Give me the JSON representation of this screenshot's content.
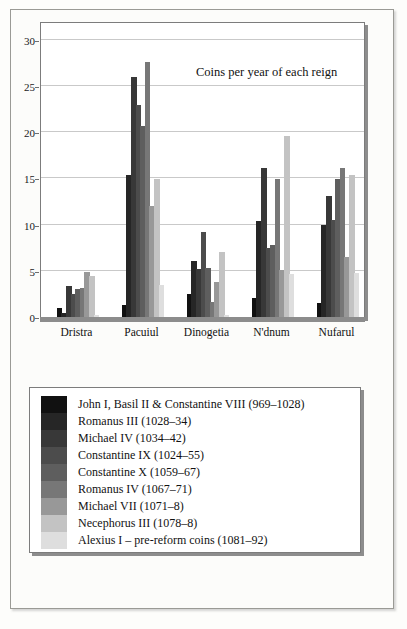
{
  "chart_data": {
    "type": "bar",
    "title": "Coins per year of each reign",
    "xlabel": "",
    "ylabel": "",
    "ylim": [
      0,
      32
    ],
    "yticks": [
      0,
      5,
      10,
      15,
      20,
      25,
      30
    ],
    "grid": true,
    "legend_position": "below-plot",
    "categories": [
      "Dristra",
      "Pacuiul",
      "Dinogetia",
      "N'dnum",
      "Nufarul"
    ],
    "series": [
      {
        "name": "John I, Basil II & Constantine VIII (969–1028)",
        "color": "#111111",
        "values": [
          1.0,
          1.3,
          2.5,
          2.1,
          1.5
        ]
      },
      {
        "name": "Romanus III (1028–34)",
        "color": "#262626",
        "values": [
          0.4,
          15.4,
          6.1,
          10.4,
          9.9
        ]
      },
      {
        "name": "Michael IV (1034–42)",
        "color": "#383838",
        "values": [
          3.4,
          25.9,
          5.2,
          16.1,
          13.1
        ]
      },
      {
        "name": "Constantine IX (1024–55)",
        "color": "#4c4c4c",
        "values": [
          2.5,
          22.9,
          9.2,
          7.5,
          10.5
        ]
      },
      {
        "name": "Constantine X (1059–67)",
        "color": "#5e5e5e",
        "values": [
          3.0,
          20.6,
          5.3,
          7.8,
          14.9
        ]
      },
      {
        "name": "Romanus IV (1067–71)",
        "color": "#777777",
        "values": [
          3.1,
          27.6,
          1.6,
          14.9,
          16.1
        ]
      },
      {
        "name": "Michael VII (1071–8)",
        "color": "#989898",
        "values": [
          4.9,
          12.0,
          3.8,
          5.1,
          6.5
        ]
      },
      {
        "name": "Necephorus III (1078–8)",
        "color": "#c3c3c3",
        "values": [
          4.4,
          14.9,
          7.0,
          19.6,
          15.3
        ]
      },
      {
        "name": "Alexius I – pre-reform coins (1081–92)",
        "color": "#dedede",
        "values": [
          0.2,
          3.5,
          0.2,
          4.6,
          4.8
        ]
      }
    ]
  },
  "legend": {
    "entries": [
      "John I, Basil II & Constantine VIII (969–1028)",
      "Romanus III (1028–34)",
      "Michael IV (1034–42)",
      "Constantine IX (1024–55)",
      "Constantine X (1059–67)",
      "Romanus IV (1067–71)",
      "Michael VII (1071–8)",
      "Necephorus III (1078–8)",
      "Alexius I – pre-reform coins (1081–92)"
    ]
  }
}
